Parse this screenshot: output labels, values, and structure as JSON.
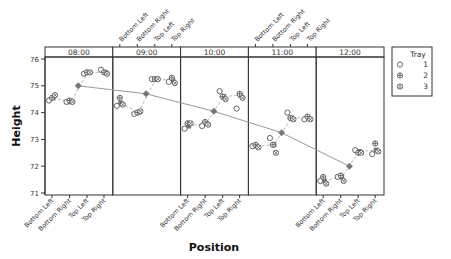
{
  "chart_data": {
    "type": "scatter",
    "title": "",
    "xlabel": "Position",
    "ylabel": "Height",
    "ylim": [
      71,
      76
    ],
    "yticks": [
      71,
      72,
      73,
      74,
      75,
      76
    ],
    "grid": false,
    "legend_position": "right",
    "legend": {
      "title": "Tray",
      "entries": [
        {
          "label": "1",
          "marker": "open-circle"
        },
        {
          "label": "2",
          "marker": "circle-plus"
        },
        {
          "label": "3",
          "marker": "circle-x"
        }
      ]
    },
    "panels": [
      "08:00",
      "09:00",
      "10:00",
      "11:00",
      "12:00"
    ],
    "categories": [
      "Bottom Left",
      "Bottom Right",
      "Top Left",
      "Top Right"
    ],
    "top_axis_panels": [
      "09:00",
      "11:00"
    ],
    "bottom_axis_panels": [
      "08:00",
      "10:00",
      "12:00"
    ],
    "series": [
      {
        "name": "1",
        "panel_values": {
          "08:00": [
            74.45,
            74.4,
            75.45,
            75.6
          ],
          "09:00": [
            74.25,
            73.95,
            75.25,
            75.15
          ],
          "10:00": [
            73.4,
            73.5,
            74.8,
            74.15
          ],
          "11:00": [
            72.75,
            73.05,
            74.0,
            73.75
          ],
          "12:00": [
            71.45,
            71.6,
            72.6,
            72.45
          ]
        }
      },
      {
        "name": "2",
        "panel_values": {
          "08:00": [
            74.55,
            74.45,
            75.5,
            75.5
          ],
          "09:00": [
            74.55,
            74.0,
            75.25,
            75.3
          ],
          "10:00": [
            73.6,
            73.65,
            74.6,
            74.7
          ],
          "11:00": [
            72.8,
            72.8,
            73.8,
            73.85
          ],
          "12:00": [
            71.6,
            71.65,
            72.5,
            72.85
          ]
        }
      },
      {
        "name": "3",
        "panel_values": {
          "08:00": [
            74.65,
            74.4,
            75.5,
            75.45
          ],
          "09:00": [
            74.3,
            74.05,
            75.25,
            75.1
          ],
          "10:00": [
            73.6,
            73.55,
            74.5,
            74.55
          ],
          "11:00": [
            72.7,
            72.5,
            73.75,
            73.75
          ],
          "12:00": [
            71.35,
            71.45,
            72.5,
            72.55
          ]
        }
      }
    ],
    "position_means": {
      "08:00": [
        74.55,
        74.4,
        75.5,
        75.5
      ],
      "09:00": [
        74.35,
        74.0,
        75.25,
        75.2
      ],
      "10:00": [
        73.5,
        73.6,
        74.6,
        74.65
      ],
      "11:00": [
        72.75,
        72.8,
        73.8,
        73.8
      ],
      "12:00": [
        71.45,
        71.6,
        72.55,
        72.6
      ]
    },
    "hour_means": {
      "08:00": 75.0,
      "09:00": 74.7,
      "10:00": 74.05,
      "11:00": 73.25,
      "12:00": 72.0
    }
  },
  "colors": {
    "frame": "#333333",
    "marker": "#555555",
    "mean_marker": "#777777",
    "mean_line": "#999999"
  }
}
